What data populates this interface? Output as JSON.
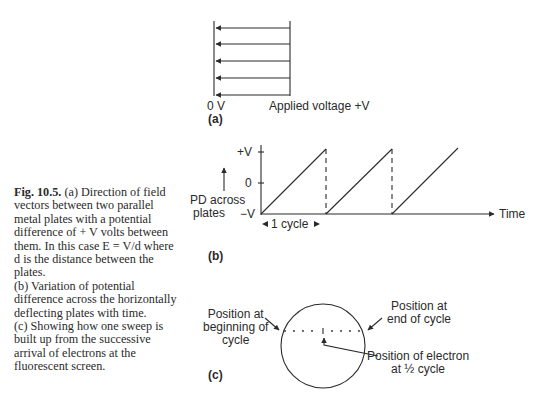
{
  "figure": {
    "number": "Fig. 10.5.",
    "caption": [
      "(a) Direction of field vectors between two parallel metal plates with a potential difference of + V volts between them. In this case E = V/d where d is the distance between the plates.",
      "(b) Variation of potential difference across the horizontally deflecting plates with time.",
      "(c) Showing how one sweep is built up from the successive arrival of electrons at the fluorescent screen."
    ]
  },
  "panel_a": {
    "label": "(a)",
    "left_plate_label": "0 V",
    "right_plate_label": "Applied voltage +V",
    "arrow_count": 5
  },
  "panel_b": {
    "label": "(b)",
    "y_axis_label_line1": "PD across",
    "y_axis_label_line2": "plates",
    "x_axis_label": "Time",
    "ticks": [
      "+V",
      "0",
      "−V"
    ],
    "cycle_label": "1 cycle"
  },
  "panel_c": {
    "label": "(c)",
    "start_label_line1": "Position at",
    "start_label_line2": "beginning of",
    "start_label_line3": "cycle",
    "end_label_line1": "Position at",
    "end_label_line2": "end of cycle",
    "mid_label_line1": "Position of electron",
    "mid_label_line2": "at ½ cycle"
  }
}
